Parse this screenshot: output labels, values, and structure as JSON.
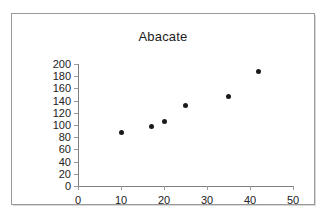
{
  "chart_data": {
    "type": "scatter",
    "title": "Abacate",
    "xlabel": "",
    "ylabel": "",
    "xlim": [
      0,
      50
    ],
    "ylim": [
      0,
      200
    ],
    "xticks": [
      0,
      10,
      20,
      30,
      40,
      50
    ],
    "yticks": [
      0,
      20,
      40,
      60,
      80,
      100,
      120,
      140,
      160,
      180,
      200
    ],
    "grid": false,
    "legend": false,
    "series": [
      {
        "name": "Abacate",
        "marker": "filled-diamond",
        "color": "#1a1a1a",
        "points": [
          {
            "x": 10,
            "y": 88
          },
          {
            "x": 17,
            "y": 97
          },
          {
            "x": 20,
            "y": 105
          },
          {
            "x": 25,
            "y": 132
          },
          {
            "x": 35,
            "y": 147
          },
          {
            "x": 42,
            "y": 188
          }
        ]
      }
    ]
  },
  "axes": {
    "y_tick_labels": [
      "200",
      "180",
      "160",
      "140",
      "120",
      "100",
      "80",
      "60",
      "40",
      "20",
      "0"
    ],
    "x_tick_labels": [
      "0",
      "10",
      "20",
      "30",
      "40",
      "50"
    ]
  },
  "colors": {
    "marker": "#1a1a1a",
    "axis": "#808080",
    "frame": "#9a9a9a",
    "text": "#222222",
    "background": "#ffffff"
  }
}
